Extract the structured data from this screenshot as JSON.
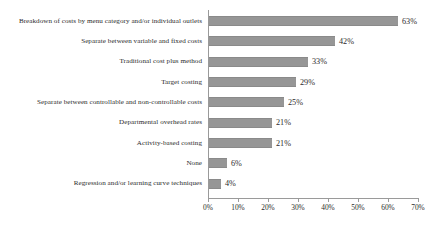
{
  "chart_data": {
    "type": "bar",
    "orientation": "horizontal",
    "title": "",
    "xlabel": "",
    "ylabel": "",
    "xlim": [
      0,
      70
    ],
    "grid": false,
    "legend": null,
    "bar_color": "#969696",
    "axis_color": "#9a9a9a",
    "text_color": "#2b2b2b",
    "background_color": "#ffffff",
    "tick_labels": [
      "0%",
      "10%",
      "20%",
      "30%",
      "40%",
      "50%",
      "60%",
      "70%"
    ],
    "tick_values": [
      0,
      10,
      20,
      30,
      40,
      50,
      60,
      70
    ],
    "categories": [
      "Breakdown of costs by menu category and/or individual outlets",
      "Separate between variable and fixed costs",
      "Traditional cost plus method",
      "Target costing",
      "Separate between controllable and non-controllable costs",
      "Departmental overhead rates",
      "Activity-based costing",
      "None",
      "Regression and/or learning curve techniques"
    ],
    "values": [
      63,
      42,
      33,
      29,
      25,
      21,
      21,
      6,
      4
    ],
    "value_labels": [
      "63%",
      "42%",
      "33%",
      "29%",
      "25%",
      "21%",
      "21%",
      "6%",
      "4%"
    ]
  }
}
